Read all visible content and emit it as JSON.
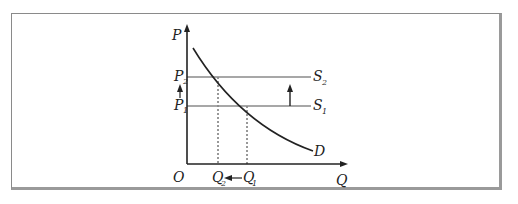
{
  "diagram": {
    "type": "supply-demand-shift",
    "axes": {
      "y_label": "P",
      "x_label": "Q",
      "origin_label": "O"
    },
    "price_levels": [
      {
        "label": "P",
        "sub": "2",
        "supply_label": "S",
        "supply_sub": "2"
      },
      {
        "label": "P",
        "sub": "1",
        "supply_label": "S",
        "supply_sub": "1"
      }
    ],
    "quantity_levels": [
      {
        "label": "Q",
        "sub": "2"
      },
      {
        "label": "Q",
        "sub": "1"
      }
    ],
    "demand_label": "D",
    "annotations": [
      "supply shifts up from S1 to S2",
      "price rises from P1 to P2",
      "quantity falls from Q1 to Q2"
    ],
    "colors": {
      "axis": "#222222",
      "supply": "#8a8a8a",
      "demand": "#222222",
      "frame": "#9a9a9a"
    }
  }
}
